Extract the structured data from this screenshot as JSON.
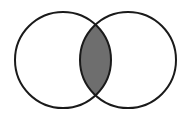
{
  "diagram": {
    "type": "venn",
    "sets": [
      {
        "name": "set-a",
        "cx": 63,
        "cy": 60,
        "r": 48
      },
      {
        "name": "set-b",
        "cx": 128,
        "cy": 60,
        "r": 48
      }
    ],
    "highlighted_region": "intersection",
    "colors": {
      "background": "#ffffff",
      "outline": "#1a1a1a",
      "intersection_fill": "#6e6e6e",
      "set_fill": "#ffffff"
    },
    "stroke_width": 2
  }
}
